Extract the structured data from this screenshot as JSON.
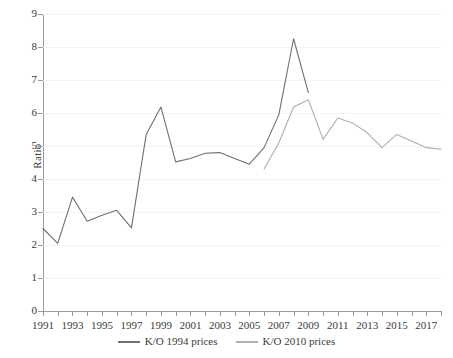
{
  "chart_data": {
    "type": "line",
    "title": "",
    "xlabel": "",
    "ylabel": "Ratio",
    "ylim": [
      0,
      9
    ],
    "xlim": [
      1991,
      2018
    ],
    "grid": true,
    "legend_position": "bottom-center",
    "y_ticks": [
      0,
      1,
      2,
      3,
      4,
      5,
      6,
      7,
      8,
      9
    ],
    "x_ticks": [
      1991,
      1992,
      1993,
      1994,
      1995,
      1996,
      1997,
      1998,
      1999,
      2000,
      2001,
      2002,
      2003,
      2004,
      2005,
      2006,
      2007,
      2008,
      2009,
      2010,
      2011,
      2012,
      2013,
      2014,
      2015,
      2016,
      2017,
      2018
    ],
    "x_tick_labels": [
      "1991",
      "",
      "1993",
      "",
      "1995",
      "",
      "1997",
      "",
      "1999",
      "",
      "2001",
      "",
      "2003",
      "",
      "2005",
      "",
      "2007",
      "",
      "2009",
      "",
      "2011",
      "",
      "2013",
      "",
      "2015",
      "",
      "2017",
      ""
    ],
    "series": [
      {
        "name": "K/O 1994 prices",
        "color": "#6f6f6f",
        "x": [
          1991,
          1992,
          1993,
          1994,
          1995,
          1996,
          1997,
          1998,
          1999,
          2000,
          2001,
          2002,
          2003,
          2004,
          2005,
          2006,
          2007,
          2008,
          2009
        ],
        "values": [
          2.5,
          2.05,
          3.45,
          2.72,
          2.9,
          3.05,
          2.52,
          5.35,
          6.18,
          4.52,
          4.62,
          4.78,
          4.8,
          4.62,
          4.45,
          4.95,
          5.95,
          8.25,
          6.62
        ]
      },
      {
        "name": "K/O 2010 prices",
        "color": "#aeaeae",
        "x": [
          2006,
          2007,
          2008,
          2009,
          2010,
          2011,
          2012,
          2013,
          2014,
          2015,
          2016,
          2017,
          2018
        ],
        "values": [
          4.3,
          5.1,
          6.18,
          6.4,
          5.2,
          5.85,
          5.7,
          5.4,
          4.95,
          5.35,
          5.15,
          4.95,
          4.9
        ]
      }
    ]
  },
  "legend": {
    "items": [
      {
        "label": "K/O 1994 prices",
        "color": "#6f6f6f"
      },
      {
        "label": "K/O 2010 prices",
        "color": "#aeaeae"
      }
    ]
  }
}
